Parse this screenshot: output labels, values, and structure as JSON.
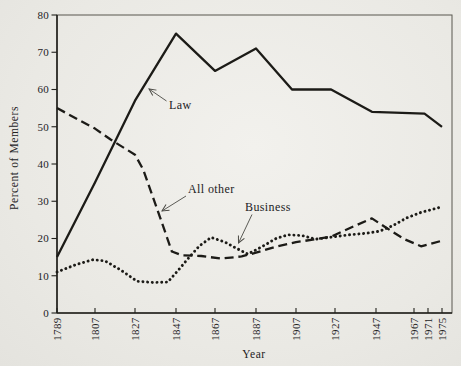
{
  "chart_data": {
    "type": "line",
    "title": "",
    "xlabel": "Year",
    "ylabel": "Percent of Members",
    "x_ticks": [
      1789,
      1807,
      1827,
      1847,
      1867,
      1887,
      1907,
      1927,
      1947,
      1967,
      1971,
      1975
    ],
    "y_ticks": [
      0,
      10,
      20,
      30,
      40,
      50,
      60,
      70,
      80
    ],
    "xlim": [
      1789,
      1980
    ],
    "ylim": [
      0,
      80
    ],
    "grid": false,
    "legend": "inline labels with arrows pointing at lines",
    "line_color": "#1c1b17",
    "paper_color": "#eae9e4",
    "series": [
      {
        "name": "Law",
        "style": "solid",
        "points": [
          [
            1789,
            15
          ],
          [
            1807,
            35
          ],
          [
            1827,
            57
          ],
          [
            1847,
            75
          ],
          [
            1867,
            65
          ],
          [
            1887,
            71
          ],
          [
            1905,
            60
          ],
          [
            1925,
            60
          ],
          [
            1945,
            54
          ],
          [
            1970,
            53.5
          ],
          [
            1975,
            50
          ]
        ]
      },
      {
        "name": "All other",
        "style": "dashed",
        "points": [
          [
            1789,
            55
          ],
          [
            1807,
            49.5
          ],
          [
            1815,
            46.5
          ],
          [
            1827,
            42.5
          ],
          [
            1831,
            38.5
          ],
          [
            1839,
            26
          ],
          [
            1845,
            16.5
          ],
          [
            1850,
            15.5
          ],
          [
            1860,
            15.3
          ],
          [
            1870,
            14.6
          ],
          [
            1880,
            15.2
          ],
          [
            1887,
            16.2
          ],
          [
            1897,
            17.8
          ],
          [
            1907,
            19
          ],
          [
            1917,
            19.8
          ],
          [
            1925,
            20.5
          ],
          [
            1933,
            22.5
          ],
          [
            1945,
            25.4
          ],
          [
            1952,
            23
          ],
          [
            1962,
            19.8
          ],
          [
            1969,
            17.9
          ],
          [
            1975,
            19.4
          ]
        ]
      },
      {
        "name": "Business",
        "style": "dotted",
        "points": [
          [
            1789,
            11
          ],
          [
            1798,
            13
          ],
          [
            1806,
            14.3
          ],
          [
            1812,
            14
          ],
          [
            1820,
            11.5
          ],
          [
            1828,
            8.5
          ],
          [
            1836,
            8.2
          ],
          [
            1843,
            8.3
          ],
          [
            1849,
            12
          ],
          [
            1853,
            14.5
          ],
          [
            1859,
            18
          ],
          [
            1865,
            20.3
          ],
          [
            1872,
            19
          ],
          [
            1877,
            17.5
          ],
          [
            1883,
            15.8
          ],
          [
            1890,
            17.8
          ],
          [
            1897,
            20
          ],
          [
            1903,
            21
          ],
          [
            1910,
            20.8
          ],
          [
            1917,
            19.8
          ],
          [
            1924,
            20.3
          ],
          [
            1934,
            21
          ],
          [
            1942,
            21.4
          ],
          [
            1949,
            22
          ],
          [
            1956,
            23.5
          ],
          [
            1963,
            25.5
          ],
          [
            1969,
            27
          ],
          [
            1975,
            28.5
          ]
        ]
      }
    ],
    "annotations": [
      {
        "label": "Law"
      },
      {
        "label": "All other"
      },
      {
        "label": "Business"
      }
    ]
  }
}
